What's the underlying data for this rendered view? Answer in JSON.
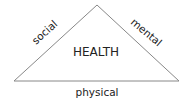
{
  "diagram": {
    "type": "triangle",
    "center_label": "HEALTH",
    "sides": {
      "left": "social",
      "right": "mental",
      "bottom": "physical"
    },
    "colors": {
      "line": "#888888",
      "text": "#222222",
      "background": "#ffffff"
    }
  }
}
